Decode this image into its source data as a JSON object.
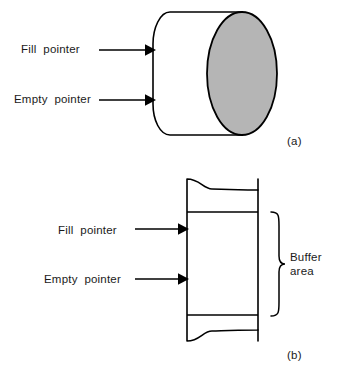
{
  "figure": {
    "panel_a": {
      "tag": "(a)",
      "shape_name": "cylinder",
      "labels": {
        "fill_pointer": "Fill  pointer",
        "empty_pointer": "Empty  pointer"
      },
      "shading_color": "#b5b5b5",
      "line_color": "#000000"
    },
    "panel_b": {
      "tag": "(b)",
      "shape_name": "broken-rectangle-buffer",
      "labels": {
        "fill_pointer": "Fill  pointer",
        "empty_pointer": "Empty  pointer",
        "buffer_area_line1": "Buffer",
        "buffer_area_line2": "area"
      },
      "line_color": "#000000"
    }
  }
}
